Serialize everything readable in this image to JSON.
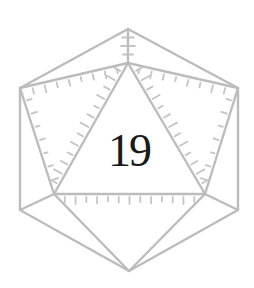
{
  "illustration": {
    "subject": "d20-die-icon",
    "face_value": "19",
    "colors": {
      "edges": "#bcbcbc",
      "number": "#1a1a1a",
      "background": "#ffffff"
    }
  }
}
